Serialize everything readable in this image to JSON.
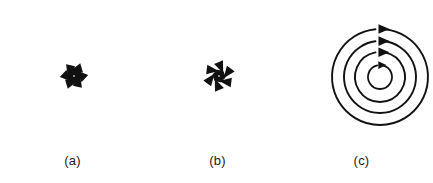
{
  "figure": {
    "background_color": "#ffffff",
    "stroke_color": "#111111",
    "width": 433,
    "height": 183
  },
  "panels": [
    {
      "key": "a",
      "label": "(a)",
      "name": "unstable-spiral",
      "description": "Unstable spiral: six spiral arms emanating outward from the center with arrowheads pointing away from the origin",
      "center": {
        "x": 74,
        "y": 76
      },
      "arm_count": 6,
      "flow_direction": "outward",
      "rotation_sense": "counterclockwise",
      "spiral": {
        "type": "logarithmic",
        "a": 1.6,
        "b": 0.31,
        "theta_start": 0.15,
        "theta_end": 4.35,
        "r_max": 68
      },
      "arrow_positions_deg": [
        0,
        60,
        120,
        180,
        240,
        300
      ]
    },
    {
      "key": "b",
      "label": "(b)",
      "name": "stable-spiral",
      "description": "Stable spiral: six spiral arms converging inward to the center with arrowheads pointing toward the origin",
      "center": {
        "x": 74,
        "y": 76
      },
      "arm_count": 6,
      "flow_direction": "inward",
      "rotation_sense": "clockwise-inward",
      "spiral": {
        "type": "logarithmic",
        "a": 1.6,
        "b": 0.31,
        "theta_start": 0.15,
        "theta_end": 4.35,
        "r_max": 68
      },
      "arrow_positions_deg": [
        0,
        60,
        120,
        180,
        240,
        300
      ]
    },
    {
      "key": "c",
      "label": "(c)",
      "name": "center",
      "description": "Center: four concentric closed circular orbits with clockwise arrowheads at the top of each circle",
      "center": {
        "x": 90,
        "y": 77
      },
      "circle_count": 4,
      "radii": [
        48,
        36,
        25,
        12
      ],
      "flow_direction": "closed-orbit",
      "rotation_sense": "clockwise",
      "arrow_angle_deg": 90
    }
  ]
}
